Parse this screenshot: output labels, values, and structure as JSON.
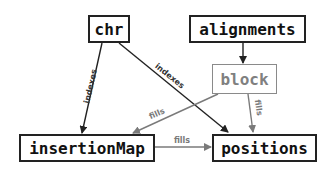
{
  "diagram": {
    "nodes": [
      {
        "id": "chr",
        "label": "chr",
        "style": "normal"
      },
      {
        "id": "alignments",
        "label": "alignments",
        "style": "normal"
      },
      {
        "id": "block",
        "label": "block",
        "style": "muted"
      },
      {
        "id": "insertionMap",
        "label": "insertionMap",
        "style": "normal"
      },
      {
        "id": "positions",
        "label": "positions",
        "style": "normal"
      }
    ],
    "edges": [
      {
        "from": "chr",
        "to": "insertionMap",
        "label": "indexes",
        "color": "#222222"
      },
      {
        "from": "chr",
        "to": "positions",
        "label": "indexes",
        "color": "#222222"
      },
      {
        "from": "alignments",
        "to": "block",
        "label": "",
        "color": "#222222"
      },
      {
        "from": "block",
        "to": "insertionMap",
        "label": "fills",
        "color": "#7a7a7a"
      },
      {
        "from": "block",
        "to": "positions",
        "label": "fills",
        "color": "#7a7a7a"
      },
      {
        "from": "insertionMap",
        "to": "positions",
        "label": "fills",
        "color": "#7a7a7a"
      }
    ],
    "colors": {
      "primary": "#222222",
      "muted": "#7a7a7a"
    }
  }
}
